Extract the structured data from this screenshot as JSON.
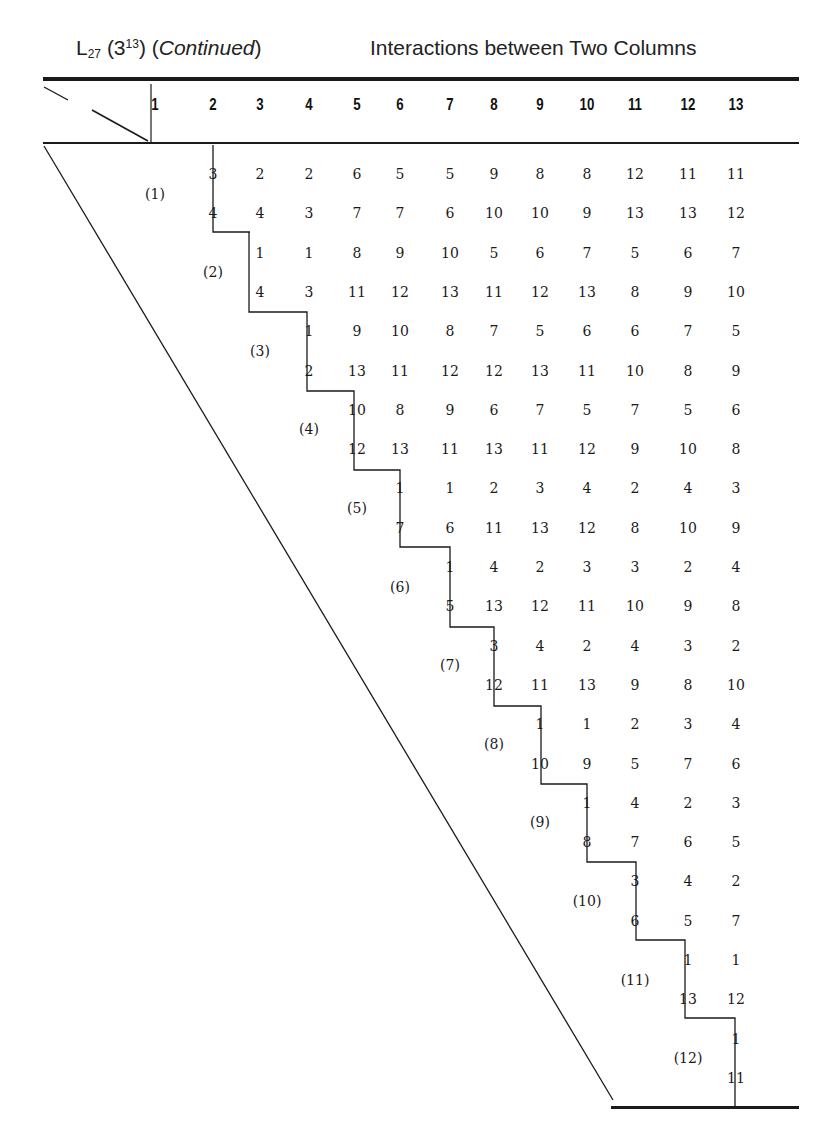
{
  "page": {
    "top_clipped_text": "Appendix: Orthogonal Arrays and Linear Graphs"
  },
  "header": {
    "array_name_base": "L",
    "array_name_sub": "27",
    "array_levels_pre": " (3",
    "array_levels_sup": "13",
    "array_levels_post": ") (",
    "continued": "Continued",
    "continued_close": ")",
    "subtitle": "Interactions between Two Columns"
  },
  "columns": [
    "1",
    "2",
    "3",
    "4",
    "5",
    "6",
    "7",
    "8",
    "9",
    "10",
    "11",
    "12",
    "13"
  ],
  "row_labels": [
    "(1)",
    "(2)",
    "(3)",
    "(4)",
    "(5)",
    "(6)",
    "(7)",
    "(8)",
    "(9)",
    "(10)",
    "(11)",
    "(12)"
  ],
  "chart_data": {
    "type": "table",
    "columns": [
      1,
      2,
      3,
      4,
      5,
      6,
      7,
      8,
      9,
      10,
      11,
      12,
      13
    ],
    "rows": [
      {
        "label": "(1)",
        "start_col": 2,
        "top": [
          "3",
          "2",
          "2",
          "6",
          "5",
          "5",
          "9",
          "8",
          "8",
          "12",
          "11",
          "11"
        ],
        "bottom": [
          "4",
          "4",
          "3",
          "7",
          "7",
          "6",
          "10",
          "10",
          "9",
          "13",
          "13",
          "12"
        ]
      },
      {
        "label": "(2)",
        "start_col": 3,
        "top": [
          "1",
          "1",
          "8",
          "9",
          "10",
          "5",
          "6",
          "7",
          "5",
          "6",
          "7"
        ],
        "bottom": [
          "4",
          "3",
          "11",
          "12",
          "13",
          "11",
          "12",
          "13",
          "8",
          "9",
          "10"
        ]
      },
      {
        "label": "(3)",
        "start_col": 4,
        "top": [
          "1",
          "9",
          "10",
          "8",
          "7",
          "5",
          "6",
          "6",
          "7",
          "5"
        ],
        "bottom": [
          "2",
          "13",
          "11",
          "12",
          "12",
          "13",
          "11",
          "10",
          "8",
          "9"
        ]
      },
      {
        "label": "(4)",
        "start_col": 5,
        "top": [
          "10",
          "8",
          "9",
          "6",
          "7",
          "5",
          "7",
          "5",
          "6"
        ],
        "bottom": [
          "12",
          "13",
          "11",
          "13",
          "11",
          "12",
          "9",
          "10",
          "8"
        ]
      },
      {
        "label": "(5)",
        "start_col": 6,
        "top": [
          "1",
          "1",
          "2",
          "3",
          "4",
          "2",
          "4",
          "3"
        ],
        "bottom": [
          "7",
          "6",
          "11",
          "13",
          "12",
          "8",
          "10",
          "9"
        ]
      },
      {
        "label": "(6)",
        "start_col": 7,
        "top": [
          "1",
          "4",
          "2",
          "3",
          "3",
          "2",
          "4"
        ],
        "bottom": [
          "5",
          "13",
          "12",
          "11",
          "10",
          "9",
          "8"
        ]
      },
      {
        "label": "(7)",
        "start_col": 8,
        "top": [
          "3",
          "4",
          "2",
          "4",
          "3",
          "2"
        ],
        "bottom": [
          "12",
          "11",
          "13",
          "9",
          "8",
          "10"
        ]
      },
      {
        "label": "(8)",
        "start_col": 9,
        "top": [
          "1",
          "1",
          "2",
          "3",
          "4"
        ],
        "bottom": [
          "10",
          "9",
          "5",
          "7",
          "6"
        ]
      },
      {
        "label": "(9)",
        "start_col": 10,
        "top": [
          "1",
          "4",
          "2",
          "3"
        ],
        "bottom": [
          "8",
          "7",
          "6",
          "5"
        ]
      },
      {
        "label": "(10)",
        "start_col": 11,
        "top": [
          "3",
          "4",
          "2"
        ],
        "bottom": [
          "6",
          "5",
          "7"
        ]
      },
      {
        "label": "(11)",
        "start_col": 12,
        "top": [
          "1",
          "1"
        ],
        "bottom": [
          "13",
          "12"
        ]
      },
      {
        "label": "(12)",
        "start_col": 13,
        "top": [
          "1"
        ],
        "bottom": [
          "11"
        ]
      }
    ]
  }
}
